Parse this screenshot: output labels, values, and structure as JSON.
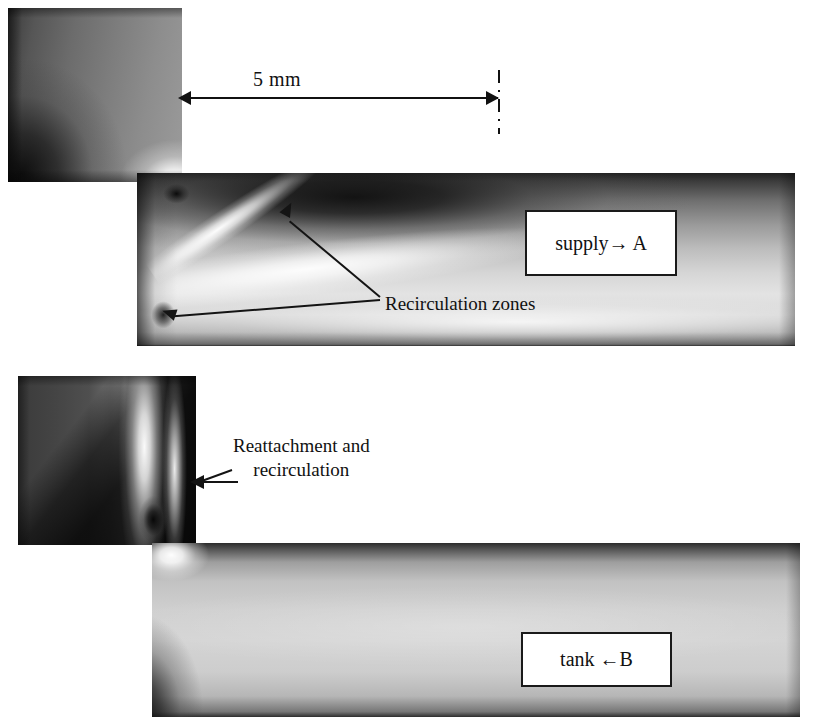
{
  "figure": {
    "panels": [
      {
        "id": "top",
        "flow_label": "supply→ A",
        "callout": "Recirculation zones"
      },
      {
        "id": "bottom",
        "flow_label": "tank ←B",
        "callout_line1": "Reattachment and",
        "callout_line2": "recirculation"
      }
    ]
  },
  "dimension": {
    "label": "5 mm",
    "value": 5,
    "unit": "mm"
  },
  "annotations": {
    "recirculation_zones": "Recirculation zones",
    "reattachment_line1": "Reattachment and",
    "reattachment_line2": "recirculation"
  },
  "ports": {
    "supply_a": "supply→ A",
    "tank_b": "tank ←B"
  },
  "colors": {
    "ink": "#111111",
    "background": "#ffffff",
    "box_border": "#1a1a1a"
  }
}
